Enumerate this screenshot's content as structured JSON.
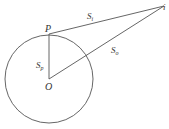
{
  "diagram": {
    "labels": {
      "p": "P",
      "o": "O",
      "i": "i",
      "si_main": "S",
      "si_sub": "i",
      "so_main": "S",
      "so_sub": "o",
      "sp_main": "S",
      "sp_sub": "p"
    },
    "stroke_color": "#555555"
  }
}
